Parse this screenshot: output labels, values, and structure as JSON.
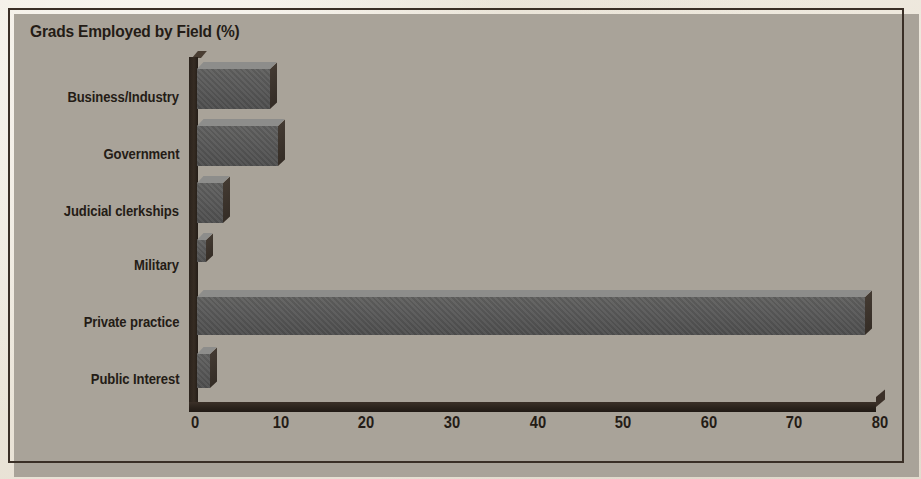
{
  "figure": {
    "title": "Grads Employed by Field (%)",
    "frame_color": "#3a2f26",
    "paper_color": "#ece7dd",
    "bar_face_color": "#575757",
    "bar_top_color": "#8d8d8b",
    "bar_side_color": "#3a322a"
  },
  "chart_data": {
    "type": "bar",
    "orientation": "horizontal",
    "title": "Grads Employed by Field (%)",
    "xlabel": "",
    "ylabel": "",
    "xlim": [
      0,
      80
    ],
    "xticks": [
      "0",
      "10",
      "20",
      "30",
      "40",
      "50",
      "60",
      "70",
      "80"
    ],
    "tick_values": [
      0,
      10,
      20,
      30,
      40,
      50,
      60,
      70,
      80
    ],
    "grid": false,
    "legend": false,
    "categories": [
      "Business/Industry",
      "Government",
      "Judicial clerkships",
      "Military",
      "Private practice",
      "Public Interest"
    ],
    "values": [
      8.5,
      9.5,
      3.0,
      1.0,
      78.0,
      1.5
    ],
    "units": "percent",
    "series": [
      {
        "name": "Grads Employed by Field (%)",
        "values": [
          8.5,
          9.5,
          3.0,
          1.0,
          78.0,
          1.5
        ]
      }
    ]
  }
}
